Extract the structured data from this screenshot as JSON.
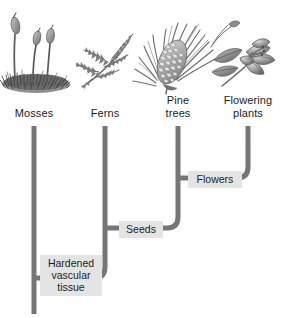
{
  "figure": {
    "kind": "cladogram",
    "width": 290,
    "height": 318,
    "background_color": "#ffffff"
  },
  "colors": {
    "branch": "#767676",
    "branch_dark": "#6a6a6a",
    "trait_label_background": "#e4e4e4",
    "text": "#1b1b1b",
    "illustration_dark": "#3d3d3d",
    "illustration_mid": "#8a8a8a",
    "illustration_light": "#bdbdbd"
  },
  "taxa": [
    {
      "id": "mosses",
      "label": "Mosses",
      "label_lines": "Mosses",
      "icon": "moss-illustration",
      "tip_x": 34,
      "label_left": 4,
      "label_top": 107,
      "label_width": 60
    },
    {
      "id": "ferns",
      "label": "Ferns",
      "label_lines": "Ferns",
      "icon": "fern-illustration",
      "tip_x": 105,
      "label_left": 77,
      "label_top": 107,
      "label_width": 56
    },
    {
      "id": "pine-trees",
      "label": "Pine trees",
      "label_lines": "Pine\ntrees",
      "icon": "pine-cone-illustration",
      "tip_x": 178,
      "label_left": 150,
      "label_top": 94,
      "label_width": 56
    },
    {
      "id": "flowering-plants",
      "label": "Flowering plants",
      "label_lines": "Flowering\nplants",
      "icon": "flowering-plant-illustration",
      "tip_x": 248,
      "label_left": 210,
      "label_top": 94,
      "label_width": 76
    }
  ],
  "trait_nodes": [
    {
      "id": "hardened-vascular-tissue",
      "label": "Hardened vascular tissue",
      "label_lines": "Hardened\nvascular\ntissue",
      "node_x": 34,
      "node_y": 278,
      "label_left": 40,
      "label_top": 255,
      "label_width": 62
    },
    {
      "id": "seeds",
      "label": "Seeds",
      "label_lines": "Seeds",
      "node_x": 105,
      "node_y": 228,
      "label_left": 119,
      "label_top": 221,
      "label_width": 44
    },
    {
      "id": "flowers",
      "label": "Flowers",
      "label_lines": "Flowers",
      "node_x": 178,
      "node_y": 178,
      "label_left": 188,
      "label_top": 171,
      "label_width": 54
    }
  ],
  "branches": {
    "stem_top_y": 126,
    "stem_gap_bottom_y": 150,
    "root_bottom_y": 314,
    "corner_radius": 11,
    "stroke_width": 5
  }
}
